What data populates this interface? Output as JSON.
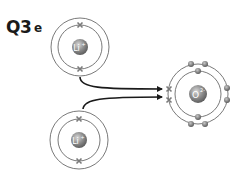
{
  "question": {
    "number": "Q3",
    "part": "e"
  },
  "atoms": [
    {
      "id": "lithium-top",
      "symbol": "Li",
      "charge": "+",
      "center": [
        80,
        47
      ],
      "shells": [
        22,
        29
      ],
      "electrons": "crosses at inner shell top and bottom"
    },
    {
      "id": "lithium-bottom",
      "symbol": "Li",
      "charge": "+",
      "center": [
        79,
        140
      ],
      "shells": [
        21,
        29
      ],
      "electrons": "crosses at inner shell top and bottom"
    },
    {
      "id": "oxygen",
      "symbol": "O",
      "charge": "2-",
      "center": [
        198,
        94
      ],
      "shells": [
        23,
        30
      ],
      "electrons": "dots: 2 on inner shell, 6 on outer shell, plus 2 transferred crosses on left of outer shell"
    }
  ],
  "arrows": [
    {
      "from": "lithium-top",
      "to": "oxygen"
    },
    {
      "from": "lithium-bottom",
      "to": "oxygen"
    }
  ],
  "colors": {
    "shell": "#6a6a6a",
    "arrow": "#1a1a1a",
    "nucleus": "#8a8a8a",
    "electron_dot": "#7a7a7a",
    "electron_cross": "#7a7a7a"
  }
}
